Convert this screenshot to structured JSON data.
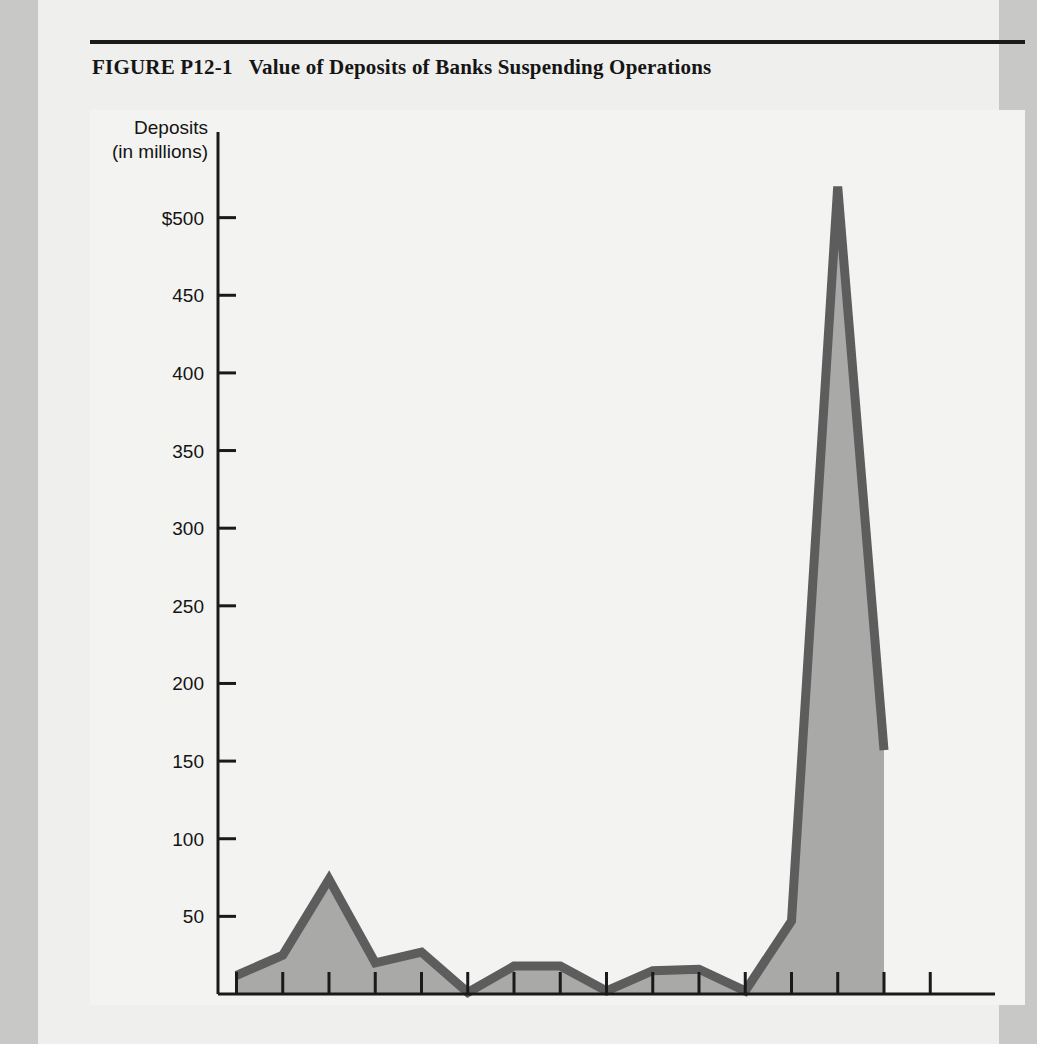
{
  "figure": {
    "number": "FIGURE  P12-1",
    "title": "Value of Deposits of Banks Suspending Operations"
  },
  "colors": {
    "page_margin": "#c8c8c6",
    "sheet": "#efefed",
    "panel": "#f3f3f1",
    "axis": "#1a1a1a",
    "line": "#5d5d5d",
    "fill": "#a9a9a7",
    "text": "#141414"
  },
  "chart_data": {
    "type": "area",
    "title": "Value of Deposits of Banks Suspending Operations",
    "xlabel": "Year",
    "ylabel": "Deposits (in millions)",
    "ylabel_line1": "Deposits",
    "ylabel_line2": "(in millions)",
    "x": [
      1969,
      1970,
      1971,
      1972,
      1973,
      1974,
      1975,
      1976,
      1977,
      1978,
      1979,
      1980,
      1981,
      1982,
      1983
    ],
    "values": [
      12,
      25,
      74,
      20,
      27,
      1,
      18,
      18,
      2,
      15,
      16,
      2,
      47,
      520,
      157
    ],
    "xlim": [
      1968.6,
      1985.4
    ],
    "ylim": [
      0,
      550
    ],
    "yticks": [
      50,
      100,
      150,
      200,
      250,
      300,
      350,
      400,
      450,
      500
    ],
    "ytick_labels": [
      "50",
      "100",
      "150",
      "200",
      "250",
      "300",
      "350",
      "400",
      "450",
      "$500"
    ],
    "xticks": [
      1969,
      1970,
      1971,
      1972,
      1973,
      1974,
      1975,
      1976,
      1977,
      1978,
      1979,
      1980,
      1981,
      1982,
      1983,
      1984
    ],
    "xtick_labels_shown": [
      "1970",
      "1972",
      "1974",
      "1976",
      "1978",
      "1980",
      "1982",
      "1984"
    ],
    "xtick_label_values": [
      1970,
      1972,
      1974,
      1976,
      1978,
      1980,
      1982,
      1984
    ],
    "grid": false,
    "legend": false,
    "axis_caption": "Year"
  }
}
